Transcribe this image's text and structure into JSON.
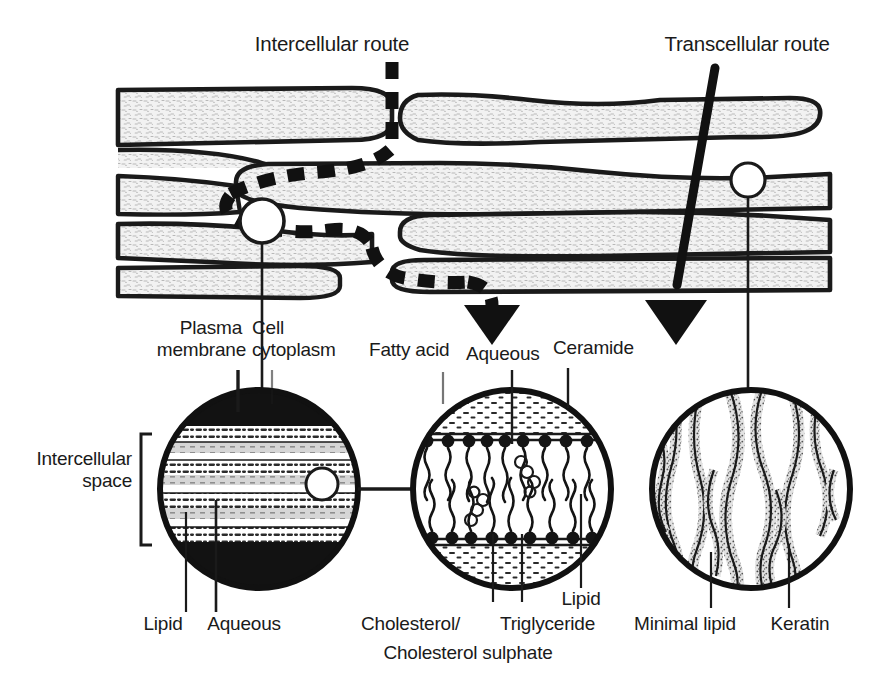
{
  "figure": {
    "background_color": "#ffffff",
    "ink_color": "#1a1a1a",
    "tissue_fill": "#ededed",
    "width": 890,
    "height": 690
  },
  "routes": {
    "intercellular": {
      "label": "Intercellular route",
      "style": "dashed-arrow",
      "description": "Tortuous dashed path winding between corneocytes"
    },
    "transcellular": {
      "label": "Transcellular route",
      "style": "solid-arrow",
      "description": "Straight solid path passing directly through corneocytes"
    }
  },
  "callouts": {
    "left": {
      "name": "intercellular-lipid-lamellae",
      "bracket_label_line1": "Intercellular",
      "bracket_label_line2": "space",
      "top_labels": [
        {
          "line1": "Plasma",
          "line2": "membrane"
        },
        {
          "line1": "Cell",
          "line2": "cytoplasm"
        }
      ],
      "bottom_labels": [
        "Lipid",
        "Aqueous"
      ]
    },
    "middle": {
      "name": "lipid-bilayer-composition",
      "top_labels": [
        "Fatty acid",
        "Aqueous",
        "Ceramide"
      ],
      "bottom_labels": [
        "Cholesterol/",
        "Cholesterol sulphate",
        "Triglyceride",
        "Lipid"
      ]
    },
    "right": {
      "name": "corneocyte-keratin",
      "bottom_labels": [
        "Minimal lipid",
        "Keratin"
      ]
    }
  },
  "labels": {
    "intercellular_route": "Intercellular route",
    "transcellular_route": "Transcellular route",
    "plasma_1": "Plasma",
    "plasma_2": "membrane",
    "cell_1": "Cell",
    "cell_2": "cytoplasm",
    "fatty_acid": "Fatty acid",
    "aqueous_top": "Aqueous",
    "ceramide": "Ceramide",
    "intercellular_1": "Intercellular",
    "intercellular_2": "space",
    "lipid_left": "Lipid",
    "aqueous_left": "Aqueous",
    "cholesterol": "Cholesterol/",
    "triglyceride": "Triglyceride",
    "cholesterol_sulphate": "Cholesterol sulphate",
    "lipid_mid": "Lipid",
    "minimal_lipid": "Minimal lipid",
    "keratin": "Keratin"
  }
}
